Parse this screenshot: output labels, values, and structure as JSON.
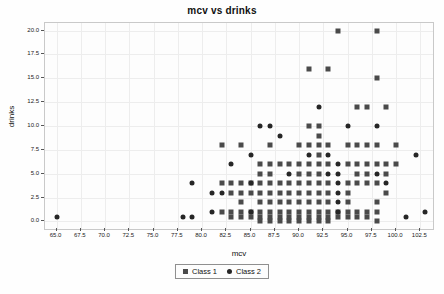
{
  "chart_data": {
    "type": "scatter",
    "title": "mcv vs drinks",
    "xlabel": "mcv",
    "ylabel": "drinks",
    "xlim": [
      63.8,
      103.8
    ],
    "ylim": [
      -0.8,
      20.8
    ],
    "grid": true,
    "legend_position": "below-axis-center",
    "xticks": [
      "65.0",
      "67.5",
      "70.0",
      "72.5",
      "75.0",
      "77.5",
      "80.0",
      "82.5",
      "85.0",
      "87.5",
      "90.0",
      "92.5",
      "95.0",
      "97.5",
      "100.0",
      "102.5"
    ],
    "xtick_values": [
      65.0,
      67.5,
      70.0,
      72.5,
      75.0,
      77.5,
      80.0,
      82.5,
      85.0,
      87.5,
      90.0,
      92.5,
      95.0,
      97.5,
      100.0,
      102.5
    ],
    "yticks": [
      "0.0",
      "2.5",
      "5.0",
      "7.5",
      "10.0",
      "12.5",
      "15.0",
      "17.5",
      "20.0"
    ],
    "ytick_values": [
      0.0,
      2.5,
      5.0,
      7.5,
      10.0,
      12.5,
      15.0,
      17.5,
      20.0
    ],
    "series": [
      {
        "name": "Class 1",
        "marker": "square",
        "color": "#4a4a4a",
        "points": [
          [
            94.0,
            20.0
          ],
          [
            98.0,
            20.0
          ],
          [
            98.0,
            15.0
          ],
          [
            91.0,
            16.0
          ],
          [
            93.0,
            16.0
          ],
          [
            96.0,
            12.0
          ],
          [
            97.0,
            12.0
          ],
          [
            99.0,
            12.0
          ],
          [
            91.0,
            10.0
          ],
          [
            92.0,
            10.0
          ],
          [
            92.0,
            9.0
          ],
          [
            82.0,
            8.0
          ],
          [
            84.0,
            8.0
          ],
          [
            87.0,
            8.0
          ],
          [
            90.0,
            8.0
          ],
          [
            91.0,
            8.0
          ],
          [
            92.0,
            8.0
          ],
          [
            93.0,
            8.0
          ],
          [
            95.0,
            8.0
          ],
          [
            96.0,
            8.0
          ],
          [
            97.0,
            8.0
          ],
          [
            98.0,
            8.0
          ],
          [
            100.0,
            8.0
          ],
          [
            92.0,
            7.0
          ],
          [
            86.0,
            6.0
          ],
          [
            87.0,
            6.0
          ],
          [
            88.0,
            6.0
          ],
          [
            89.0,
            6.0
          ],
          [
            90.0,
            6.0
          ],
          [
            91.0,
            6.0
          ],
          [
            92.0,
            6.0
          ],
          [
            93.0,
            6.0
          ],
          [
            95.0,
            6.0
          ],
          [
            96.0,
            6.0
          ],
          [
            97.0,
            6.0
          ],
          [
            98.0,
            6.0
          ],
          [
            99.0,
            6.0
          ],
          [
            100.0,
            6.0
          ],
          [
            86.0,
            5.0
          ],
          [
            87.0,
            5.0
          ],
          [
            90.0,
            5.0
          ],
          [
            91.0,
            5.0
          ],
          [
            92.0,
            5.0
          ],
          [
            96.0,
            5.0
          ],
          [
            97.0,
            5.0
          ],
          [
            99.0,
            5.0
          ],
          [
            82.0,
            4.0
          ],
          [
            83.0,
            4.0
          ],
          [
            84.0,
            4.0
          ],
          [
            85.0,
            4.0
          ],
          [
            86.0,
            4.0
          ],
          [
            87.0,
            4.0
          ],
          [
            88.0,
            4.0
          ],
          [
            89.0,
            4.0
          ],
          [
            90.0,
            4.0
          ],
          [
            91.0,
            4.0
          ],
          [
            92.0,
            4.0
          ],
          [
            93.0,
            4.0
          ],
          [
            95.0,
            4.0
          ],
          [
            96.0,
            4.0
          ],
          [
            97.0,
            4.0
          ],
          [
            98.0,
            4.0
          ],
          [
            83.0,
            3.0
          ],
          [
            84.0,
            3.0
          ],
          [
            85.0,
            3.0
          ],
          [
            86.0,
            3.0
          ],
          [
            87.0,
            3.0
          ],
          [
            88.0,
            3.0
          ],
          [
            89.0,
            3.0
          ],
          [
            90.0,
            3.0
          ],
          [
            91.0,
            3.0
          ],
          [
            92.0,
            3.0
          ],
          [
            93.0,
            3.0
          ],
          [
            95.0,
            3.0
          ],
          [
            99.0,
            3.0
          ],
          [
            84.0,
            2.0
          ],
          [
            86.0,
            2.0
          ],
          [
            87.0,
            2.0
          ],
          [
            88.0,
            2.0
          ],
          [
            89.0,
            2.0
          ],
          [
            90.0,
            2.0
          ],
          [
            91.0,
            2.0
          ],
          [
            92.0,
            2.0
          ],
          [
            93.0,
            2.0
          ],
          [
            95.0,
            2.0
          ],
          [
            98.0,
            2.0
          ],
          [
            82.0,
            1.0
          ],
          [
            83.0,
            1.0
          ],
          [
            84.0,
            1.0
          ],
          [
            85.0,
            1.0
          ],
          [
            86.0,
            1.0
          ],
          [
            87.0,
            1.0
          ],
          [
            88.0,
            1.0
          ],
          [
            89.0,
            1.0
          ],
          [
            90.0,
            1.0
          ],
          [
            91.0,
            1.0
          ],
          [
            92.0,
            1.0
          ],
          [
            93.0,
            1.0
          ],
          [
            94.0,
            1.0
          ],
          [
            95.0,
            1.0
          ],
          [
            96.0,
            1.0
          ],
          [
            97.0,
            1.0
          ],
          [
            98.0,
            1.0
          ],
          [
            83.0,
            0.5
          ],
          [
            84.0,
            0.5
          ],
          [
            85.0,
            0.5
          ],
          [
            86.0,
            0.5
          ],
          [
            87.0,
            0.5
          ],
          [
            88.0,
            0.5
          ],
          [
            89.0,
            0.5
          ],
          [
            90.0,
            0.5
          ],
          [
            91.0,
            0.5
          ],
          [
            92.0,
            0.5
          ],
          [
            93.0,
            0.5
          ],
          [
            94.0,
            0.5
          ],
          [
            95.0,
            0.5
          ],
          [
            96.0,
            0.5
          ],
          [
            97.0,
            0.5
          ],
          [
            86.0,
            0.0
          ],
          [
            87.0,
            0.0
          ],
          [
            88.0,
            0.0
          ],
          [
            89.0,
            0.0
          ],
          [
            90.0,
            0.0
          ],
          [
            91.0,
            0.0
          ],
          [
            92.0,
            0.0
          ],
          [
            93.0,
            0.0
          ],
          [
            98.0,
            0.0
          ]
        ]
      },
      {
        "name": "Class 2",
        "marker": "circle",
        "color": "#262626",
        "points": [
          [
            86.0,
            10.0
          ],
          [
            87.0,
            10.0
          ],
          [
            95.0,
            10.0
          ],
          [
            98.0,
            10.0
          ],
          [
            92.0,
            12.0
          ],
          [
            88.0,
            9.0
          ],
          [
            85.0,
            7.0
          ],
          [
            91.0,
            7.0
          ],
          [
            93.0,
            7.0
          ],
          [
            102.0,
            7.0
          ],
          [
            83.0,
            6.0
          ],
          [
            94.0,
            6.0
          ],
          [
            79.0,
            4.0
          ],
          [
            94.0,
            4.0
          ],
          [
            99.0,
            4.0
          ],
          [
            81.0,
            3.0
          ],
          [
            82.0,
            3.0
          ],
          [
            94.0,
            3.0
          ],
          [
            65.0,
            0.5
          ],
          [
            78.0,
            0.5
          ],
          [
            79.0,
            0.5
          ],
          [
            101.0,
            0.5
          ],
          [
            81.0,
            1.0
          ],
          [
            103.0,
            1.0
          ],
          [
            85.0,
            1.0
          ],
          [
            94.0,
            1.0
          ],
          [
            94.0,
            5.0
          ],
          [
            98.0,
            5.0
          ],
          [
            89.0,
            5.0
          ],
          [
            93.0,
            5.0
          ],
          [
            85.0,
            4.0
          ],
          [
            94.0,
            2.0
          ]
        ]
      }
    ]
  },
  "legend": {
    "entries": [
      {
        "label": "Class 1",
        "marker": "square"
      },
      {
        "label": "Class 2",
        "marker": "circle"
      }
    ]
  }
}
